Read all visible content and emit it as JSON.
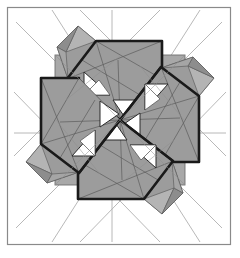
{
  "figure": {
    "canvas": {
      "width": 240,
      "height": 258
    },
    "colors": {
      "background": "#ffffff",
      "frame_stroke": "#8a8a8a",
      "base_fill": "#a8a8a8",
      "module_fill": "#9c9c9c",
      "module_fill_light": "#b5b5b5",
      "module_fill_dark": "#8d8d8d",
      "white_fill": "#ffffff",
      "heavy_stroke": "#1a1a1a",
      "medium_stroke": "#4a4a4a",
      "construction_stroke": "#b0b0b0",
      "grid_stroke": "#9a9a9a"
    },
    "frame": {
      "x": 7,
      "y": 7,
      "width": 224,
      "height": 238,
      "stroke_width": 1.2
    },
    "base_square": {
      "x": 55,
      "y": 55,
      "width": 130,
      "height": 130
    },
    "center": {
      "x": 120,
      "y": 120
    },
    "rotation_symmetry": 4,
    "grid": {
      "label": "internal quarter grid",
      "vertical_x": [
        55,
        87.5,
        120,
        152.5,
        185
      ],
      "horizontal_y": [
        55,
        87.5,
        120,
        152.5,
        185
      ]
    },
    "construction_star": {
      "label": "eight-pointed construction star",
      "lines": [
        {
          "x1": 18,
          "y1": 133,
          "x2": 222,
          "y2": 133
        },
        {
          "x1": 112,
          "y1": 16,
          "x2": 112,
          "y2": 236
        },
        {
          "x1": 22,
          "y1": 26,
          "x2": 216,
          "y2": 224
        },
        {
          "x1": 216,
          "y1": 26,
          "x2": 22,
          "y2": 224
        },
        {
          "x1": 82,
          "y1": 16,
          "x2": 216,
          "y2": 150
        },
        {
          "x1": 158,
          "y1": 16,
          "x2": 24,
          "y2": 150
        },
        {
          "x1": 24,
          "y1": 96,
          "x2": 158,
          "y2": 232
        },
        {
          "x1": 216,
          "y1": 96,
          "x2": 82,
          "y2": 232
        },
        {
          "x1": 60,
          "y1": 20,
          "x2": 196,
          "y2": 228
        },
        {
          "x1": 196,
          "y1": 20,
          "x2": 60,
          "y2": 228
        }
      ]
    },
    "modules": [
      {
        "name": "module-top-left",
        "orientation_deg": 0,
        "description": "parallelogram arm with two white triangles and outer flap",
        "white_triangle_count": 2
      },
      {
        "name": "module-top-right",
        "orientation_deg": 90,
        "description": "parallelogram arm with two white triangles and outer flap",
        "white_triangle_count": 2
      },
      {
        "name": "module-bottom-right",
        "orientation_deg": 180,
        "description": "parallelogram arm with two white triangles and outer flap",
        "white_triangle_count": 2
      },
      {
        "name": "module-bottom-left",
        "orientation_deg": 270,
        "description": "parallelogram arm with two white triangles and outer flap",
        "white_triangle_count": 2
      }
    ],
    "module_geometry": {
      "arm_outline": "M 120,120 L 68,80 L 97,42 L 161,42 L 161,80 Z",
      "arm_main": [
        {
          "x": 120,
          "y": 120
        },
        {
          "x": 66,
          "y": 78
        },
        {
          "x": 96,
          "y": 40
        },
        {
          "x": 162,
          "y": 40
        }
      ],
      "white_triangle_a": [
        {
          "x": 86,
          "y": 94
        },
        {
          "x": 110,
          "y": 94
        },
        {
          "x": 86,
          "y": 72
        }
      ],
      "white_triangle_b": [
        {
          "x": 116,
          "y": 100
        },
        {
          "x": 140,
          "y": 100
        },
        {
          "x": 128,
          "y": 118
        }
      ],
      "flap": [
        {
          "x": 96,
          "y": 40
        },
        {
          "x": 78,
          "y": 26
        },
        {
          "x": 56,
          "y": 46
        },
        {
          "x": 66,
          "y": 78
        }
      ]
    },
    "caption": ""
  }
}
